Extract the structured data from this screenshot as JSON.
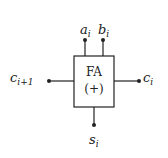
{
  "diagram": {
    "block": {
      "name": "FA",
      "operator": "(+)",
      "description": "Full adder block"
    },
    "inputs": {
      "top_left": {
        "base": "a",
        "sub": "i"
      },
      "top_right": {
        "base": "b",
        "sub": "i"
      },
      "left": {
        "base": "c",
        "sub": "i+1"
      }
    },
    "outputs": {
      "right": {
        "base": "c",
        "sub": "i"
      },
      "bottom": {
        "base": "s",
        "sub": "i"
      }
    },
    "colors": {
      "stroke": "#222222",
      "background": "#ffffff"
    }
  }
}
